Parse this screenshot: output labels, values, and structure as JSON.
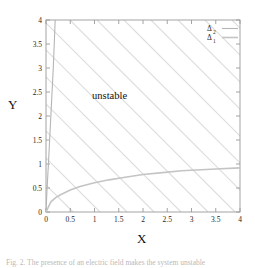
{
  "figure": {
    "caption": "Fig. 2.  The presence of an electric field makes the system unstable",
    "region_label": "unstable"
  },
  "chart_data": {
    "type": "line",
    "title": "",
    "xlabel": "X",
    "ylabel": "Y",
    "xlim": [
      0,
      4
    ],
    "ylim": [
      0,
      4
    ],
    "grid": false,
    "legend_position": "top-right",
    "xticks": [
      "0",
      "0.5",
      "1",
      "1.5",
      "2",
      "2.5",
      "3",
      "3.5",
      "4"
    ],
    "xtick_values": [
      0,
      0.5,
      1,
      1.5,
      2,
      2.5,
      3,
      3.5,
      4
    ],
    "yticks": [
      "0",
      "0.5",
      "1",
      "1.5",
      "2",
      "2.5",
      "3",
      "3.5",
      "4"
    ],
    "ytick_values": [
      0,
      0.5,
      1,
      1.5,
      2,
      2.5,
      3,
      3.5,
      4
    ],
    "annotations": [
      {
        "text": "unstable",
        "x": 0.95,
        "y": 2.35
      }
    ],
    "series": [
      {
        "name": "Δ2",
        "label_base": "Δ",
        "label_sub": "2",
        "color": "#b5b5b5",
        "x": [
          0.0,
          0.02,
          0.05,
          0.08,
          0.11,
          0.13,
          0.15,
          0.16,
          0.17,
          0.18,
          0.185,
          0.19
        ],
        "y": [
          0.0,
          0.45,
          1.0,
          1.6,
          2.2,
          2.6,
          3.0,
          3.25,
          3.5,
          3.75,
          3.9,
          4.0
        ]
      },
      {
        "name": "Δ1",
        "label_base": "Δ",
        "label_sub": "1",
        "color": "#c4c4c4",
        "x": [
          0.0,
          0.1,
          0.2,
          0.3,
          0.5,
          0.7,
          1.0,
          1.3,
          1.6,
          2.0,
          2.4,
          2.8,
          3.2,
          3.6,
          4.0
        ],
        "y": [
          0.0,
          0.21,
          0.3,
          0.36,
          0.46,
          0.53,
          0.61,
          0.67,
          0.72,
          0.78,
          0.82,
          0.86,
          0.88,
          0.9,
          0.92
        ]
      }
    ],
    "hatching": {
      "present": true,
      "color": "#dcdcdc",
      "direction": "diagonal-down-right",
      "spacing_px": 27
    }
  }
}
